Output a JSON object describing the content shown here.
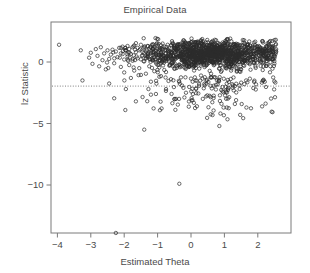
{
  "chart_data": {
    "type": "scatter",
    "title": "Empirical Data",
    "xlabel": "Estimated Theta",
    "ylabel": "lz Statistic",
    "xlim": [
      -4.35,
      2.6
    ],
    "ylim": [
      -15.2,
      2.3
    ],
    "grid": false,
    "legend": null,
    "xticks": [
      -4,
      -3,
      -2,
      -1,
      0,
      1,
      2
    ],
    "xtick_labels": [
      "−4",
      "−3",
      "−2",
      "−1",
      "0",
      "1",
      "2"
    ],
    "yticks": [
      0,
      -5,
      -10
    ],
    "ytick_labels": [
      "0",
      "−5",
      "−10"
    ],
    "marker": {
      "shape": "open-circle",
      "radius": 1.7,
      "color": "#2b2b2b",
      "fill": "none",
      "stroke_width": 0.7
    },
    "reference_lines": [
      {
        "orientation": "horizontal",
        "value": -1.96,
        "style": "dotted",
        "color": "#6f6f6f",
        "label": "lz critical value -1.96"
      }
    ],
    "annotations": [],
    "points": [
      [
        -3.95,
        1.4
      ],
      [
        -3.3,
        0.95
      ],
      [
        -3.25,
        -1.5
      ],
      [
        -3.05,
        0.35
      ],
      [
        -3.0,
        0.75
      ],
      [
        -2.95,
        -0.15
      ],
      [
        -2.85,
        1.05
      ],
      [
        -2.8,
        0.5
      ],
      [
        -2.75,
        -0.35
      ],
      [
        -2.7,
        1.2
      ],
      [
        -2.65,
        0.15
      ],
      [
        -2.6,
        0.7
      ],
      [
        -2.55,
        -0.6
      ],
      [
        -2.5,
        0.95
      ],
      [
        -2.45,
        0.25
      ],
      [
        -2.45,
        -1.75
      ],
      [
        -2.4,
        0.6
      ],
      [
        -2.35,
        1.0
      ],
      [
        -2.3,
        -0.1
      ],
      [
        -2.3,
        -2.95
      ],
      [
        -2.25,
        0.85
      ],
      [
        -2.25,
        -13.9
      ],
      [
        -2.2,
        0.4
      ],
      [
        -2.15,
        1.15
      ],
      [
        -2.1,
        -0.4
      ],
      [
        -2.1,
        0.7
      ],
      [
        -2.05,
        1.25
      ],
      [
        -2.0,
        0.2
      ],
      [
        -2.0,
        -0.85
      ],
      [
        -1.95,
        0.95
      ],
      [
        -1.95,
        -2.2
      ],
      [
        -1.9,
        1.3
      ],
      [
        -1.9,
        0.45
      ],
      [
        -1.85,
        -0.25
      ],
      [
        -1.85,
        1.05
      ],
      [
        -1.8,
        0.65
      ],
      [
        -1.8,
        -1.3
      ],
      [
        -1.75,
        1.2
      ],
      [
        -1.75,
        0.1
      ],
      [
        -1.7,
        -0.7
      ],
      [
        -1.7,
        1.35
      ],
      [
        -1.65,
        0.8
      ],
      [
        -1.65,
        -3.2
      ],
      [
        -1.6,
        0.3
      ],
      [
        -1.6,
        1.15
      ],
      [
        -1.55,
        -0.5
      ],
      [
        -1.55,
        0.95
      ],
      [
        -1.5,
        1.4
      ],
      [
        -1.5,
        -1.05
      ],
      [
        -1.45,
        0.55
      ],
      [
        -1.45,
        -2.85
      ],
      [
        -1.4,
        1.2
      ],
      [
        -1.4,
        0.05
      ],
      [
        -1.4,
        -5.5
      ],
      [
        -1.35,
        0.85
      ],
      [
        -1.35,
        -0.95
      ],
      [
        -1.3,
        1.3
      ],
      [
        -1.3,
        0.4
      ],
      [
        -1.25,
        -0.35
      ],
      [
        -1.25,
        1.05
      ],
      [
        -1.2,
        0.7
      ],
      [
        -1.2,
        -1.6
      ],
      [
        -1.15,
        1.45
      ],
      [
        -1.15,
        0.15
      ],
      [
        -1.1,
        -0.75
      ],
      [
        -1.1,
        1.2
      ],
      [
        -1.05,
        0.9
      ],
      [
        -1.05,
        -2.6
      ],
      [
        -1.0,
        0.35
      ],
      [
        -1.0,
        1.35
      ],
      [
        -0.95,
        -0.45
      ],
      [
        -0.95,
        1.0
      ],
      [
        -0.9,
        0.6
      ],
      [
        -0.9,
        -1.15
      ],
      [
        -0.85,
        1.5
      ],
      [
        -0.85,
        0.2
      ],
      [
        -0.8,
        -0.65
      ],
      [
        -0.8,
        1.25
      ],
      [
        -0.75,
        0.95
      ],
      [
        -0.75,
        -2.35
      ],
      [
        -0.7,
        0.45
      ],
      [
        -0.7,
        1.4
      ],
      [
        -0.65,
        -0.3
      ],
      [
        -0.65,
        1.1
      ],
      [
        -0.6,
        0.75
      ],
      [
        -0.6,
        -1.4
      ],
      [
        -0.55,
        1.55
      ],
      [
        -0.55,
        0.25
      ],
      [
        -0.5,
        -0.55
      ],
      [
        -0.5,
        1.3
      ],
      [
        -0.45,
        1.0
      ],
      [
        -0.45,
        -3.0
      ],
      [
        -0.4,
        0.5
      ],
      [
        -0.4,
        1.45
      ],
      [
        -0.35,
        -0.2
      ],
      [
        -0.35,
        1.15
      ],
      [
        -0.35,
        -9.9
      ],
      [
        -0.3,
        0.85
      ],
      [
        -0.3,
        -1.25
      ],
      [
        -0.25,
        1.6
      ],
      [
        -0.25,
        0.35
      ],
      [
        -0.2,
        -0.45
      ],
      [
        -0.2,
        1.35
      ],
      [
        -0.15,
        1.05
      ],
      [
        -0.15,
        -2.5
      ],
      [
        -0.1,
        0.6
      ],
      [
        -0.1,
        1.5
      ],
      [
        -0.05,
        -0.1
      ],
      [
        -0.05,
        1.2
      ],
      [
        0.0,
        0.9
      ],
      [
        0.0,
        -1.35
      ],
      [
        0.05,
        1.65
      ],
      [
        0.05,
        0.4
      ],
      [
        0.1,
        -0.35
      ],
      [
        0.1,
        1.4
      ],
      [
        0.15,
        1.1
      ],
      [
        0.15,
        -2.15
      ],
      [
        0.2,
        0.7
      ],
      [
        0.2,
        1.55
      ],
      [
        0.25,
        0.0
      ],
      [
        0.25,
        1.25
      ],
      [
        0.3,
        0.95
      ],
      [
        0.3,
        -1.1
      ],
      [
        0.35,
        1.7
      ],
      [
        0.35,
        0.45
      ],
      [
        0.4,
        -0.25
      ],
      [
        0.4,
        1.45
      ],
      [
        0.45,
        1.15
      ],
      [
        0.45,
        -2.8
      ],
      [
        0.5,
        0.75
      ],
      [
        0.5,
        1.6
      ],
      [
        0.55,
        0.1
      ],
      [
        0.55,
        1.3
      ],
      [
        0.6,
        1.0
      ],
      [
        0.6,
        -0.95
      ],
      [
        0.65,
        1.5
      ],
      [
        0.65,
        0.5
      ],
      [
        0.7,
        -0.2
      ],
      [
        0.7,
        1.35
      ],
      [
        0.75,
        1.2
      ],
      [
        0.75,
        -1.85
      ],
      [
        0.8,
        0.8
      ],
      [
        0.8,
        1.55
      ],
      [
        0.85,
        0.15
      ],
      [
        0.85,
        1.25
      ],
      [
        0.9,
        1.05
      ],
      [
        0.9,
        -0.8
      ],
      [
        0.95,
        1.45
      ],
      [
        0.95,
        0.55
      ],
      [
        1.0,
        -0.15
      ],
      [
        1.0,
        1.3
      ],
      [
        1.05,
        1.15
      ],
      [
        1.05,
        -2.45
      ],
      [
        1.1,
        0.85
      ],
      [
        1.1,
        1.5
      ],
      [
        1.15,
        0.2
      ],
      [
        1.15,
        1.2
      ],
      [
        1.2,
        1.0
      ],
      [
        1.2,
        -0.7
      ],
      [
        1.25,
        1.4
      ],
      [
        1.25,
        0.6
      ],
      [
        1.3,
        -0.1
      ],
      [
        1.3,
        1.25
      ],
      [
        1.35,
        1.1
      ],
      [
        1.35,
        -3.1
      ],
      [
        1.4,
        0.9
      ],
      [
        1.4,
        1.45
      ],
      [
        1.45,
        0.3
      ],
      [
        1.45,
        1.15
      ],
      [
        1.5,
        0.95
      ],
      [
        1.5,
        -0.6
      ],
      [
        1.55,
        1.35
      ],
      [
        1.55,
        0.65
      ],
      [
        1.6,
        0.05
      ],
      [
        1.6,
        1.2
      ],
      [
        1.65,
        1.05
      ],
      [
        1.65,
        -1.5
      ],
      [
        1.7,
        0.85
      ],
      [
        1.7,
        1.4
      ],
      [
        1.75,
        0.35
      ],
      [
        1.8,
        1.1
      ],
      [
        1.85,
        0.9
      ],
      [
        1.9,
        1.15
      ],
      [
        1.95,
        0.7
      ],
      [
        2.0,
        1.0
      ],
      [
        2.05,
        0.8
      ],
      [
        2.15,
        0.95
      ],
      [
        2.25,
        0.85
      ],
      [
        2.35,
        0.9
      ],
      [
        2.45,
        0.8
      ],
      [
        2.55,
        0.85
      ]
    ],
    "cluster_description": {
      "n_points_approx": 1400,
      "dense_core_theta": [
        -0.3,
        1.8
      ],
      "dense_core_lz": [
        -0.6,
        1.6
      ],
      "tail_theta_min": -4.0,
      "tail_theta_max": 2.6,
      "outliers": [
        [
          -0.35,
          -9.9
        ],
        [
          -2.25,
          -13.9
        ]
      ]
    }
  }
}
